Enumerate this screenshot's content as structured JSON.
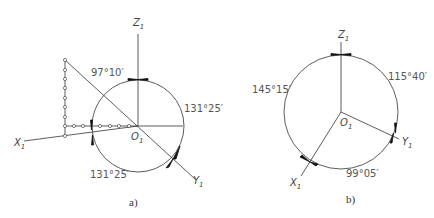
{
  "figures": [
    {
      "id": "a",
      "caption": "a)",
      "axes": {
        "x": "X",
        "y": "Y",
        "z": "Z",
        "subscript": "1",
        "origin": "O"
      },
      "angles": [
        {
          "label": "97°10′",
          "between": "X1-Z1"
        },
        {
          "label": "131°25′",
          "between": "Z1-Y1"
        },
        {
          "label": "131°25′",
          "between": "X1-Y1"
        }
      ]
    },
    {
      "id": "b",
      "caption": "b)",
      "axes": {
        "x": "X",
        "y": "Y",
        "z": "Z",
        "subscript": "1",
        "origin": "O"
      },
      "angles": [
        {
          "label": "145°15′",
          "between": "X1-Z1"
        },
        {
          "label": "115°40′",
          "between": "Z1-Y1"
        },
        {
          "label": "99°05′",
          "between": "X1-Y1"
        }
      ]
    }
  ]
}
